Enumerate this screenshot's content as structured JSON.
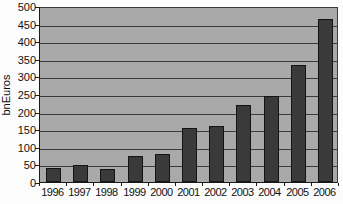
{
  "chart_data": {
    "type": "bar",
    "title": "",
    "xlabel": "",
    "ylabel": "bnEuros",
    "categories": [
      "1996",
      "1997",
      "1998",
      "1999",
      "2000",
      "2001",
      "2002",
      "2003",
      "2004",
      "2005",
      "2006"
    ],
    "values": [
      40,
      48,
      38,
      73,
      80,
      153,
      158,
      220,
      245,
      333,
      462
    ],
    "ylim": [
      0,
      500
    ],
    "ytick_step": 50,
    "ytick_labels": [
      "500",
      "450",
      "400",
      "350",
      "300",
      "250",
      "200",
      "150",
      "100",
      "50",
      "0"
    ],
    "grid": "horizontal",
    "legend": "none",
    "colors": {
      "plot_bg": "#a9a9a9",
      "gridline": "#3c3c3c",
      "bar_fill": "#3a3a3a",
      "bar_border": "#141414",
      "axis": "#1a1a1a",
      "text": "#111111",
      "outer_bg": "#fcfcfc"
    }
  }
}
